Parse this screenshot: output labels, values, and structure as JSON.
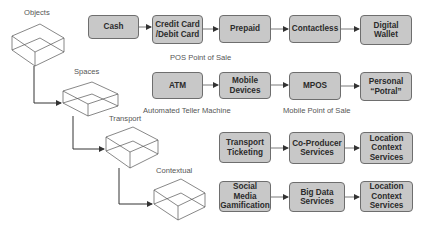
{
  "levels": [
    {
      "label": "Objects"
    },
    {
      "label": "Spaces"
    },
    {
      "label": "Transport"
    },
    {
      "label": "Contextual"
    }
  ],
  "rows": [
    {
      "boxes": [
        "Cash",
        "Credit Card\n/Debit Card",
        "Prepaid",
        "Contactless",
        "Digital\nWallet"
      ],
      "captions": [
        "POS Point of Sale"
      ]
    },
    {
      "boxes": [
        "ATM",
        "Mobile\nDevices",
        "MPOS",
        "Personal\n“Potral”"
      ],
      "captions": [
        "Automated Teller Machine",
        "Mobile Point of Sale"
      ]
    },
    {
      "boxes": [
        "Transport\nTicketing",
        "Co-Producer\nServices",
        "Location\nContext\nServices"
      ],
      "captions": []
    },
    {
      "boxes": [
        "Social\nMedia\nGamification",
        "Big Data\nServices",
        "Location\nContext\nServices"
      ],
      "captions": []
    }
  ],
  "colors": {
    "box_fill": "#c8c8c8",
    "box_border": "#6e6e6e",
    "line": "#333333"
  }
}
